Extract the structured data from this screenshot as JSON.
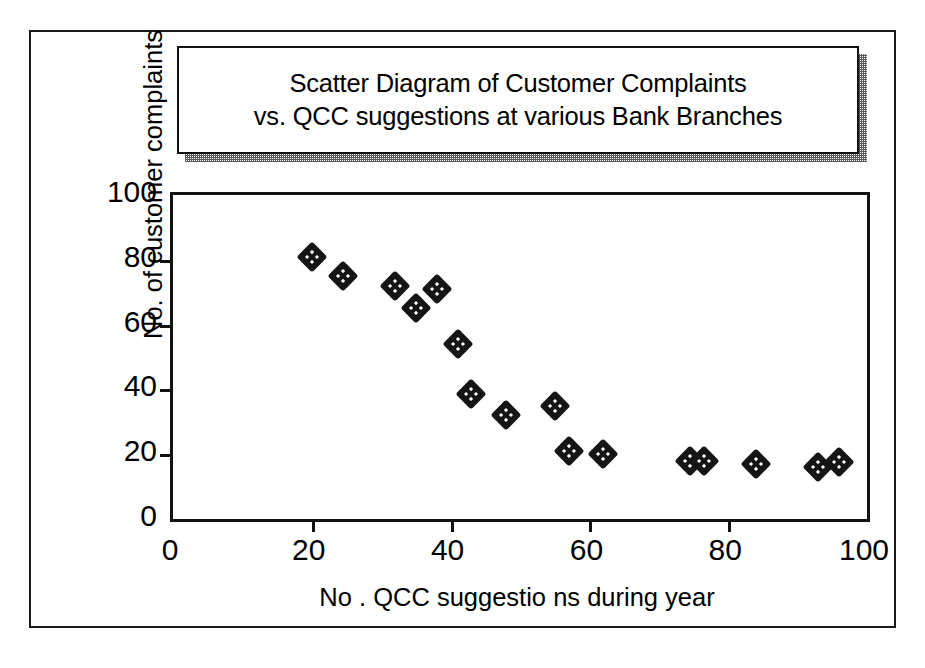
{
  "figure": {
    "title_line_1": "Scatter Diagram of Customer Complaints",
    "title_line_2": "vs. QCC suggestions at various Bank Branches"
  },
  "chart_data": {
    "type": "scatter",
    "title": "Scatter Diagram of Customer Complaints vs. QCC suggestions at various Bank Branches",
    "xlabel": "No . QCC suggestio ns during year",
    "ylabel": "No. of customer complaints",
    "xlim": [
      0,
      100
    ],
    "ylim": [
      0,
      100
    ],
    "xticks": [
      0,
      20,
      40,
      60,
      80,
      100
    ],
    "yticks": [
      0,
      20,
      40,
      60,
      80,
      100
    ],
    "grid": false,
    "legend": null,
    "marker": "diamond",
    "marker_color": "#151515",
    "points": [
      {
        "x": 20,
        "y": 81
      },
      {
        "x": 24.5,
        "y": 75
      },
      {
        "x": 32,
        "y": 72
      },
      {
        "x": 35,
        "y": 65
      },
      {
        "x": 38,
        "y": 71
      },
      {
        "x": 41,
        "y": 54
      },
      {
        "x": 43,
        "y": 38.5
      },
      {
        "x": 48,
        "y": 32
      },
      {
        "x": 55,
        "y": 35
      },
      {
        "x": 57,
        "y": 21
      },
      {
        "x": 62,
        "y": 20
      },
      {
        "x": 74.5,
        "y": 18
      },
      {
        "x": 76.5,
        "y": 18
      },
      {
        "x": 84,
        "y": 17
      },
      {
        "x": 93,
        "y": 16
      },
      {
        "x": 96,
        "y": 17.5
      }
    ]
  },
  "axis": {
    "x_tick_labels": [
      "0",
      "20",
      "40",
      "60",
      "80",
      "100"
    ],
    "y_tick_labels": [
      "0",
      "20",
      "40",
      "60",
      "80",
      "100"
    ],
    "x_title": "No . QCC suggestio ns during year",
    "y_title": "No. of customer complaints"
  }
}
